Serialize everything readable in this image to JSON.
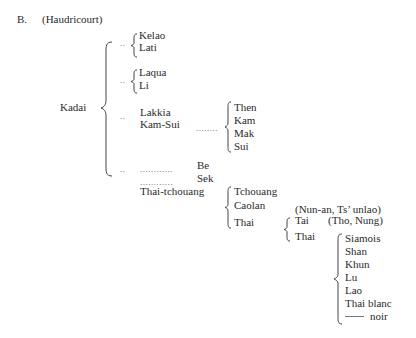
{
  "header": {
    "section_label": "B.",
    "source": "(Haudricourt)"
  },
  "root": {
    "label": "Kadai"
  },
  "groups": {
    "g1": {
      "marker": "..",
      "items": [
        "Kelao",
        "Lati"
      ]
    },
    "g2": {
      "marker": "..",
      "items": [
        "Laqua",
        "Li"
      ]
    },
    "g3": {
      "marker": "..",
      "items": [
        "Lakkia",
        "Kam-Sui"
      ],
      "kamsui_leader": "........",
      "kamsui_children": [
        "Then",
        "Kam",
        "Mak",
        "Sui"
      ]
    },
    "g4": {
      "marker": "..",
      "leader1": "............",
      "leader2": "............",
      "items": [
        "Be",
        "Sek"
      ],
      "thai_tchouang": "Thai-tchouang",
      "tt_children": [
        "Tchouang",
        "Caolan",
        "Thai"
      ],
      "caolan_note": "(Nun-an, Ts’ unlao)",
      "thai_children": [
        "Tai",
        "Thai"
      ],
      "tai_note": "(Tho, Nung)",
      "thai_leaves": [
        "Siamois",
        "Shan",
        "Khun",
        "Lu",
        "Lao",
        "Thai blanc",
        "noir"
      ]
    }
  }
}
